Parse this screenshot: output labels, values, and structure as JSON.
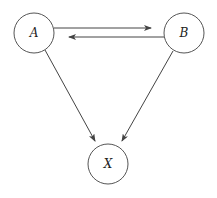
{
  "diagram": {
    "type": "directed-graph",
    "nodes": [
      {
        "id": "A",
        "label": "A",
        "cx": 34,
        "cy": 33,
        "r": 20
      },
      {
        "id": "B",
        "label": "B",
        "cx": 184,
        "cy": 33,
        "r": 20
      },
      {
        "id": "X",
        "label": "X",
        "cx": 108,
        "cy": 164,
        "r": 20
      }
    ],
    "edges": [
      {
        "from": "A",
        "to": "B"
      },
      {
        "from": "B",
        "to": "A"
      },
      {
        "from": "A",
        "to": "X"
      },
      {
        "from": "B",
        "to": "X"
      }
    ]
  },
  "colors": {
    "stroke": "#444444",
    "background": "#ffffff"
  }
}
